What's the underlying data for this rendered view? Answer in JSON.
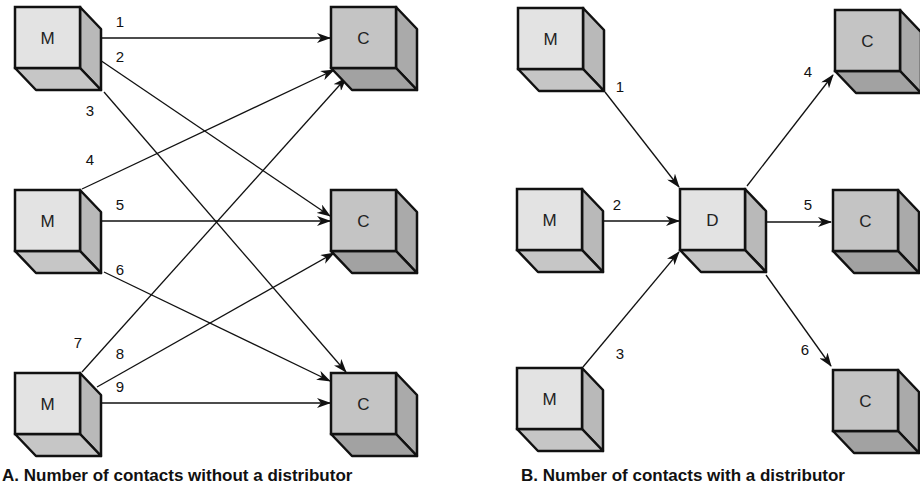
{
  "colors": {
    "m_front": "#e3e3e3",
    "m_side": "#b9b9b9",
    "m_bottom": "#c6c6c6",
    "c_front": "#c4c4c4",
    "c_side": "#aaaaaa",
    "c_bottom": "#a2a2a2",
    "d_front": "#e3e3e3",
    "d_side": "#b9b9b9",
    "d_bottom": "#c6c6c6",
    "stroke": "#111111"
  },
  "panel_a": {
    "caption": "A. Number of contacts without a distributor",
    "nodes": [
      {
        "id": "a-m1",
        "label": "M",
        "kind": "m",
        "x": 15,
        "y": 7
      },
      {
        "id": "a-m2",
        "label": "M",
        "kind": "m",
        "x": 15,
        "y": 190
      },
      {
        "id": "a-m3",
        "label": "M",
        "kind": "m",
        "x": 15,
        "y": 373
      },
      {
        "id": "a-c1",
        "label": "C",
        "kind": "c",
        "x": 331,
        "y": 7
      },
      {
        "id": "a-c2",
        "label": "C",
        "kind": "c",
        "x": 331,
        "y": 190
      },
      {
        "id": "a-c3",
        "label": "C",
        "kind": "c",
        "x": 331,
        "y": 373
      }
    ],
    "edges": [
      {
        "label": "1",
        "from": [
          97,
          38
        ],
        "to": [
          330,
          38
        ],
        "lx": 120,
        "ly": 27
      },
      {
        "label": "2",
        "from": [
          97,
          58
        ],
        "to": [
          330,
          216
        ],
        "lx": 120,
        "ly": 62
      },
      {
        "label": "3",
        "from": [
          104,
          92
        ],
        "to": [
          346,
          372
        ],
        "lx": 90,
        "ly": 116
      },
      {
        "label": "4",
        "from": [
          82,
          189
        ],
        "to": [
          334,
          70
        ],
        "lx": 90,
        "ly": 165
      },
      {
        "label": "5",
        "from": [
          97,
          221
        ],
        "to": [
          330,
          221
        ],
        "lx": 120,
        "ly": 210
      },
      {
        "label": "6",
        "from": [
          104,
          272
        ],
        "to": [
          330,
          381
        ],
        "lx": 120,
        "ly": 275
      },
      {
        "label": "7",
        "from": [
          82,
          372
        ],
        "to": [
          346,
          78
        ],
        "lx": 78,
        "ly": 348
      },
      {
        "label": "8",
        "from": [
          97,
          387
        ],
        "to": [
          334,
          253
        ],
        "lx": 120,
        "ly": 359
      },
      {
        "label": "9",
        "from": [
          97,
          403
        ],
        "to": [
          330,
          403
        ],
        "lx": 120,
        "ly": 392
      }
    ]
  },
  "panel_b": {
    "caption": "B. Number of contacts with a distributor",
    "nodes": [
      {
        "id": "b-m1",
        "label": "M",
        "kind": "m",
        "x": 518,
        "y": 8
      },
      {
        "id": "b-m2",
        "label": "M",
        "kind": "m",
        "x": 517,
        "y": 189
      },
      {
        "id": "b-m3",
        "label": "M",
        "kind": "m",
        "x": 517,
        "y": 368
      },
      {
        "id": "b-d",
        "label": "D",
        "kind": "d",
        "x": 680,
        "y": 189
      },
      {
        "id": "b-c1",
        "label": "C",
        "kind": "c",
        "x": 835,
        "y": 10
      },
      {
        "id": "b-c2",
        "label": "C",
        "kind": "c",
        "x": 833,
        "y": 190
      },
      {
        "id": "b-c3",
        "label": "C",
        "kind": "c",
        "x": 833,
        "y": 370
      }
    ],
    "edges": [
      {
        "label": "1",
        "from": [
          605,
          92
        ],
        "to": [
          679,
          187
        ],
        "lx": 620,
        "ly": 92
      },
      {
        "label": "2",
        "from": [
          597,
          221
        ],
        "to": [
          679,
          221
        ],
        "lx": 617,
        "ly": 210
      },
      {
        "label": "3",
        "from": [
          583,
          367
        ],
        "to": [
          679,
          252
        ],
        "lx": 620,
        "ly": 359
      },
      {
        "label": "4",
        "from": [
          747,
          186
        ],
        "to": [
          833,
          75
        ],
        "lx": 808,
        "ly": 77
      },
      {
        "label": "5",
        "from": [
          760,
          222
        ],
        "to": [
          831,
          222
        ],
        "lx": 808,
        "ly": 210
      },
      {
        "label": "6",
        "from": [
          766,
          275
        ],
        "to": [
          831,
          366
        ],
        "lx": 805,
        "ly": 355
      }
    ]
  }
}
